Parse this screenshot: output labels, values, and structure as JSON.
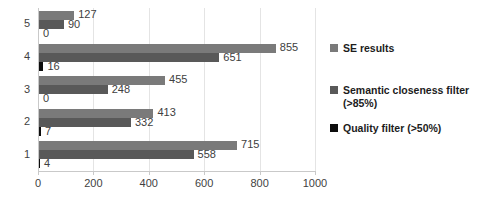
{
  "chart_data": {
    "type": "bar",
    "orientation": "horizontal",
    "title": "",
    "xlabel": "",
    "ylabel": "",
    "categories": [
      "1",
      "2",
      "3",
      "4",
      "5"
    ],
    "category_order_top_to_bottom": [
      "5",
      "4",
      "3",
      "2",
      "1"
    ],
    "xlim": [
      0,
      1000
    ],
    "xticks": [
      0,
      200,
      400,
      600,
      800,
      1000
    ],
    "xtick_labels": [
      "0",
      "200",
      "400",
      "600",
      "800",
      "1000"
    ],
    "grid": true,
    "grid_axis": "x",
    "legend_position": "right",
    "series": [
      {
        "name": "SE results",
        "color": "#7a7a7a",
        "values": [
          715,
          413,
          455,
          855,
          127
        ],
        "labels": [
          "715",
          "413",
          "455",
          "855",
          "127"
        ]
      },
      {
        "name": "Semantic closeness filter (>85%)",
        "color": "#595959",
        "values": [
          558,
          332,
          248,
          651,
          90
        ],
        "labels": [
          "558",
          "332",
          "248",
          "651",
          "90"
        ]
      },
      {
        "name": "Quality filter (>50%)",
        "color": "#0d0d0d",
        "values": [
          4,
          7,
          0,
          16,
          0
        ],
        "labels": [
          "4",
          "7",
          "0",
          "16",
          "0"
        ]
      }
    ]
  },
  "legend": {
    "items": [
      {
        "label": "SE results"
      },
      {
        "label": "Semantic closeness filter (>85%)"
      },
      {
        "label": "Quality filter (>50%)"
      }
    ]
  }
}
